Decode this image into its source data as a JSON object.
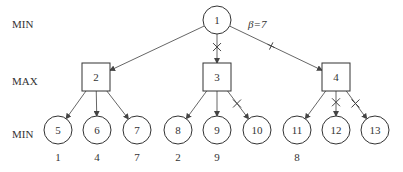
{
  "levels": [
    {
      "label": "MIN",
      "y": 24
    },
    {
      "label": "MAX",
      "y": 81
    },
    {
      "label": "MIN",
      "y": 134
    }
  ],
  "annotation": {
    "text": "β=7",
    "x": 248,
    "y": 24
  },
  "nodes": [
    {
      "id": "1",
      "shape": "circle",
      "x": 217,
      "y": 20
    },
    {
      "id": "2",
      "shape": "square",
      "x": 96,
      "y": 77
    },
    {
      "id": "3",
      "shape": "square",
      "x": 217,
      "y": 77
    },
    {
      "id": "4",
      "shape": "square",
      "x": 336,
      "y": 77
    },
    {
      "id": "5",
      "shape": "circle",
      "x": 58,
      "y": 130,
      "value": "1"
    },
    {
      "id": "6",
      "shape": "circle",
      "x": 97,
      "y": 130,
      "value": "4"
    },
    {
      "id": "7",
      "shape": "circle",
      "x": 137,
      "y": 130,
      "value": "7"
    },
    {
      "id": "8",
      "shape": "circle",
      "x": 178,
      "y": 130,
      "value": "2"
    },
    {
      "id": "9",
      "shape": "circle",
      "x": 217,
      "y": 130,
      "value": "9"
    },
    {
      "id": "10",
      "shape": "circle",
      "x": 257,
      "y": 130,
      "value": ""
    },
    {
      "id": "11",
      "shape": "circle",
      "x": 297,
      "y": 130,
      "value": "8"
    },
    {
      "id": "12",
      "shape": "circle",
      "x": 336,
      "y": 130,
      "value": ""
    },
    {
      "id": "13",
      "shape": "circle",
      "x": 375,
      "y": 130,
      "value": ""
    }
  ],
  "edges": [
    {
      "from": "1",
      "to": "2",
      "mark": "none"
    },
    {
      "from": "1",
      "to": "3",
      "mark": "cross"
    },
    {
      "from": "1",
      "to": "4",
      "mark": "plus"
    },
    {
      "from": "2",
      "to": "5",
      "mark": "none"
    },
    {
      "from": "2",
      "to": "6",
      "mark": "none"
    },
    {
      "from": "2",
      "to": "7",
      "mark": "none"
    },
    {
      "from": "3",
      "to": "8",
      "mark": "none"
    },
    {
      "from": "3",
      "to": "9",
      "mark": "none"
    },
    {
      "from": "3",
      "to": "10",
      "mark": "cross"
    },
    {
      "from": "4",
      "to": "11",
      "mark": "none"
    },
    {
      "from": "4",
      "to": "12",
      "mark": "cross"
    },
    {
      "from": "4",
      "to": "13",
      "mark": "cross"
    }
  ],
  "colors": {
    "line": "#555555",
    "text": "#333333",
    "background": "#ffffff"
  }
}
